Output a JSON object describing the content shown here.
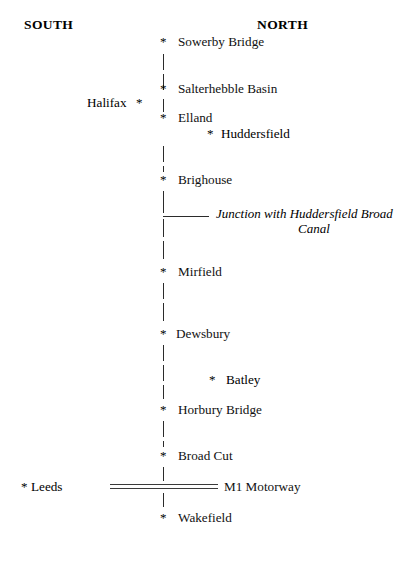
{
  "diagram": {
    "orientation": {
      "south_label": "SOUTH",
      "north_label": "NORTH"
    },
    "marker_glyph": "*",
    "colors": {
      "line": "#2b2b2b",
      "text": "#111111",
      "background": "#ffffff"
    },
    "canal_stops": [
      {
        "label": "Sowerby Bridge",
        "y": 35,
        "marker": "*"
      },
      {
        "label": "Salterhebble Basin",
        "y": 82,
        "marker": "*"
      },
      {
        "label": "Elland",
        "y": 111,
        "marker": "*"
      },
      {
        "label": "Brighouse",
        "y": 173,
        "marker": "*"
      },
      {
        "label": "Mirfield",
        "y": 265,
        "marker": "*"
      },
      {
        "label": "Dewsbury",
        "y": 327,
        "marker": "*"
      },
      {
        "label": "Horbury Bridge",
        "y": 403,
        "marker": "*"
      },
      {
        "label": "Broad Cut",
        "y": 449,
        "marker": "*"
      },
      {
        "label": "Wakefield",
        "y": 511,
        "marker": "*"
      }
    ],
    "off_line_places": [
      {
        "label": "Halifax",
        "marker": "*",
        "side": "west",
        "y": 96,
        "label_x": 87,
        "star_x": 136
      },
      {
        "label": "Huddersfield",
        "marker": "*",
        "side": "east",
        "y": 127,
        "label_x": 221,
        "star_x": 207
      },
      {
        "label": "Batley",
        "marker": "*",
        "side": "east",
        "y": 373,
        "label_x": 226,
        "star_x": 209
      },
      {
        "label": "Leeds",
        "marker": "*",
        "side": "west",
        "y": 480,
        "label_x": 31,
        "star_x": 21
      }
    ],
    "junction": {
      "line1": "Junction with Huddersfield Broad",
      "line2": "Canal"
    },
    "motorway": {
      "label": "M1 Motorway",
      "label_x": 224,
      "y": 480
    }
  }
}
